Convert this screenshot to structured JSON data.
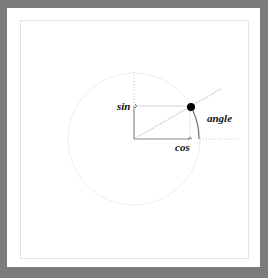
{
  "diagram": {
    "labels": {
      "sin": "sin",
      "cos": "cos",
      "angle": "angle"
    },
    "geometry": {
      "center": [
        134,
        139
      ],
      "radius": 66,
      "point": [
        191,
        107
      ],
      "point_radius": 4
    },
    "colors": {
      "frame": "#7b7b7b",
      "panel": "#ffffff",
      "inner_border": "#e4e4e4",
      "circle": "#eeeeee",
      "guide": "#c8c8c8",
      "solid_line": "#8a8a8a",
      "dot": "#000000"
    }
  }
}
